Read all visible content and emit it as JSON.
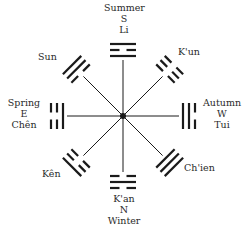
{
  "diagram": {
    "center": {
      "x": 123,
      "y": 116
    },
    "colors": {
      "ink": "#1a1a1a",
      "text": "#2a2a2a",
      "background": "#ffffff"
    },
    "trigrams": [
      {
        "id": "li",
        "name": "Li",
        "direction": "S",
        "season": "Summer",
        "angle_deg": -90,
        "lines_inner_to_outer": [
          1,
          0,
          1
        ]
      },
      {
        "id": "kun",
        "name": "K'un",
        "direction": "",
        "season": "",
        "angle_deg": -45,
        "lines_inner_to_outer": [
          0,
          0,
          0
        ]
      },
      {
        "id": "tui",
        "name": "Tui",
        "direction": "W",
        "season": "Autumn",
        "angle_deg": 0,
        "lines_inner_to_outer": [
          1,
          1,
          0
        ]
      },
      {
        "id": "chien",
        "name": "Ch'ien",
        "direction": "",
        "season": "",
        "angle_deg": 45,
        "lines_inner_to_outer": [
          1,
          1,
          1
        ]
      },
      {
        "id": "kan",
        "name": "K'an",
        "direction": "N",
        "season": "Winter",
        "angle_deg": 90,
        "lines_inner_to_outer": [
          0,
          1,
          0
        ]
      },
      {
        "id": "ken",
        "name": "Kên",
        "direction": "",
        "season": "",
        "angle_deg": 135,
        "lines_inner_to_outer": [
          0,
          0,
          1
        ]
      },
      {
        "id": "chen",
        "name": "Chên",
        "direction": "E",
        "season": "Spring",
        "angle_deg": 180,
        "lines_inner_to_outer": [
          1,
          0,
          0
        ]
      },
      {
        "id": "sun",
        "name": "Sun",
        "direction": "",
        "season": "",
        "angle_deg": -135,
        "lines_inner_to_outer": [
          0,
          1,
          1
        ]
      }
    ]
  },
  "labels": {
    "top": {
      "season": "Summer",
      "direction": "S",
      "name": "Li"
    },
    "upper_right": {
      "name": "K'un"
    },
    "right": {
      "season": "Autumn",
      "direction": "W",
      "name": "Tui"
    },
    "lower_right": {
      "name": "Ch'ien"
    },
    "bottom": {
      "name": "K'an",
      "direction": "N",
      "season": "Winter"
    },
    "lower_left": {
      "name": "Kên"
    },
    "left": {
      "season": "Spring",
      "direction": "E",
      "name": "Chên"
    },
    "upper_left": {
      "name": "Sun"
    }
  }
}
